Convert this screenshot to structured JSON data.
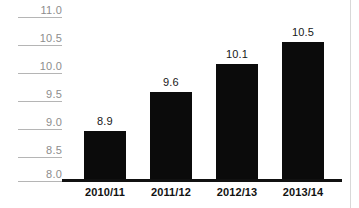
{
  "chart_data": {
    "type": "bar",
    "title": "",
    "subtitle": "",
    "xlabel": "",
    "ylabel": "",
    "categories": [
      "2010/11",
      "2011/12",
      "2012/13",
      "2013/14"
    ],
    "values": [
      8.9,
      9.6,
      10.1,
      10.5
    ],
    "value_labels": [
      "8.9",
      "9.6",
      "10.1",
      "10.5"
    ],
    "ylim": [
      8.0,
      11.0
    ],
    "ytick_values": [
      11.0,
      10.5,
      10.0,
      9.5,
      9.0,
      8.5,
      8.0
    ],
    "ytick_labels": [
      "11.0",
      "10.5",
      "10.0",
      "9.5",
      "9.0",
      "8.5",
      "8.0"
    ],
    "grid": false,
    "legend": null,
    "legend_position": "none",
    "series": [
      {
        "name": "",
        "values": [
          8.9,
          9.6,
          10.1,
          10.5
        ]
      }
    ],
    "colors": {
      "bar": "#0b0b0b",
      "axis_line": "#111111",
      "ytick_text": "#8d8d8d",
      "ytick_rule": "#b5b5b5",
      "value_text": "#171717",
      "category_text": "#121212",
      "background": "#ffffff"
    }
  }
}
